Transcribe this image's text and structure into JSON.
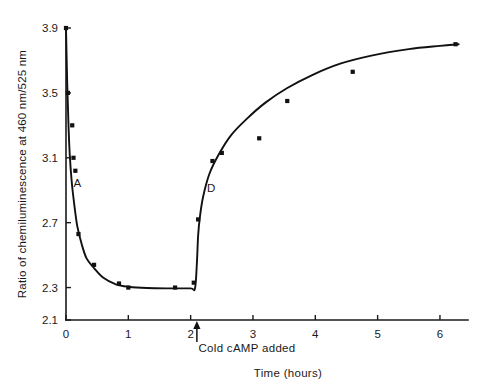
{
  "chart_data": {
    "type": "line",
    "title": "",
    "xlabel": "Time (hours)",
    "ylabel": "Ratio of chemiluminescence at 460 nm/525 nm",
    "xlim": [
      0,
      6.45
    ],
    "ylim": [
      2.1,
      3.9
    ],
    "grid": false,
    "legend": "none",
    "xticks": [
      0,
      1,
      2,
      3,
      4,
      5,
      6
    ],
    "xticklabels": [
      "0",
      "1",
      "2",
      "3",
      "4",
      "5",
      "6"
    ],
    "yticks": [
      2.1,
      2.3,
      2.7,
      3.1,
      3.5,
      3.9
    ],
    "yticklabels": [
      "2.1",
      "2.3",
      "2.7",
      "3.1",
      "3.5",
      "3.9"
    ],
    "series": [
      {
        "name": "Ratio of chemiluminescence",
        "x": [
          0.0,
          0.03,
          0.07,
          0.1,
          0.13,
          0.2,
          0.45,
          0.85,
          1.0,
          1.75,
          2.08,
          2.12,
          2.2,
          2.35,
          2.5,
          3.1,
          3.55,
          4.6,
          6.25
        ],
        "y": [
          3.9,
          3.5,
          3.3,
          3.1,
          3.02,
          2.63,
          2.44,
          2.33,
          2.3,
          2.3,
          2.3,
          2.72,
          2.9,
          3.08,
          3.13,
          3.22,
          3.43,
          3.63,
          3.8
        ]
      }
    ],
    "curve_points": [
      [
        0.0,
        3.9
      ],
      [
        0.02,
        3.55
      ],
      [
        0.04,
        3.3
      ],
      [
        0.06,
        3.12
      ],
      [
        0.09,
        2.96
      ],
      [
        0.13,
        2.82
      ],
      [
        0.18,
        2.68
      ],
      [
        0.25,
        2.57
      ],
      [
        0.33,
        2.48
      ],
      [
        0.45,
        2.42
      ],
      [
        0.6,
        2.36
      ],
      [
        0.8,
        2.32
      ],
      [
        1.0,
        2.305
      ],
      [
        1.3,
        2.297
      ],
      [
        1.7,
        2.295
      ],
      [
        2.0,
        2.295
      ],
      [
        2.07,
        2.295
      ],
      [
        2.1,
        2.45
      ],
      [
        2.12,
        2.62
      ],
      [
        2.15,
        2.74
      ],
      [
        2.2,
        2.86
      ],
      [
        2.3,
        3.0
      ],
      [
        2.45,
        3.12
      ],
      [
        2.65,
        3.24
      ],
      [
        2.9,
        3.34
      ],
      [
        3.2,
        3.44
      ],
      [
        3.55,
        3.53
      ],
      [
        3.95,
        3.61
      ],
      [
        4.4,
        3.68
      ],
      [
        4.9,
        3.73
      ],
      [
        5.5,
        3.77
      ],
      [
        6.0,
        3.79
      ],
      [
        6.3,
        3.8
      ]
    ],
    "markers": [
      [
        0.0,
        3.9
      ],
      [
        0.03,
        3.5
      ],
      [
        0.1,
        3.3
      ],
      [
        0.12,
        3.1
      ],
      [
        0.15,
        3.02
      ],
      [
        0.2,
        2.63
      ],
      [
        0.45,
        2.44
      ],
      [
        0.85,
        2.325
      ],
      [
        1.0,
        2.3
      ],
      [
        1.75,
        2.3
      ],
      [
        2.05,
        2.33
      ],
      [
        2.12,
        2.72
      ],
      [
        2.35,
        3.08
      ],
      [
        2.5,
        3.13
      ],
      [
        3.1,
        3.22
      ],
      [
        3.55,
        3.45
      ],
      [
        4.6,
        3.63
      ],
      [
        6.25,
        3.8
      ]
    ],
    "annotations": [
      {
        "text": "A",
        "x": 0.18,
        "y": 2.92,
        "name": "phase-label-a"
      },
      {
        "text": "D",
        "x": 2.33,
        "y": 2.89,
        "name": "phase-label-d"
      },
      {
        "text": "Cold cAMP added",
        "x": 2.1,
        "y": 2.1,
        "name": "cold-camp-annotation"
      }
    ],
    "event_marker": {
      "label": "Cold cAMP added",
      "x": 2.1,
      "arrow_direction": "up"
    }
  }
}
